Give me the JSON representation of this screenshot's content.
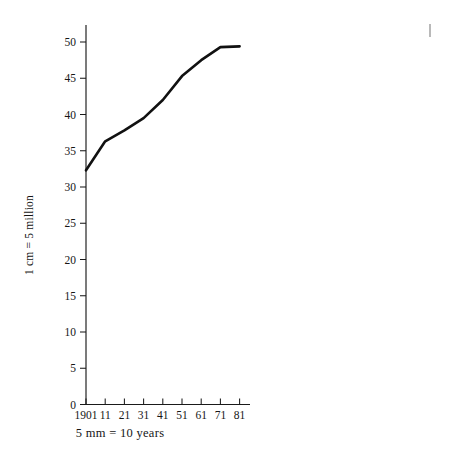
{
  "figure": {
    "background_color": "#ffffff",
    "ink_color": "#111111",
    "y_axis_label": "1 cm = 5 million",
    "x_axis_caption": "5 mm = 10 years",
    "stray_mark_name": "pencil-tick-mark"
  },
  "chart_data": {
    "type": "line",
    "title": "",
    "xlabel": "5 mm = 10 years",
    "ylabel": "1 cm = 5 million",
    "categories": [
      "1901",
      "11",
      "21",
      "31",
      "41",
      "51",
      "61",
      "71",
      "81"
    ],
    "x": [
      1901,
      1911,
      1921,
      1931,
      1941,
      1951,
      1961,
      1971,
      1981
    ],
    "values": [
      32.3,
      36.3,
      37.8,
      39.5,
      42.0,
      45.3,
      47.5,
      49.3,
      49.4
    ],
    "series": [
      {
        "name": "Population (millions)",
        "values": [
          32.3,
          36.3,
          37.8,
          39.5,
          42.0,
          45.3,
          47.5,
          49.3,
          49.4
        ]
      }
    ],
    "ylim": [
      0,
      52
    ],
    "xlim": [
      1901,
      1986
    ],
    "y_ticks": [
      0,
      5,
      10,
      15,
      20,
      25,
      30,
      35,
      40,
      45,
      50
    ],
    "y_tick_labels": [
      "0",
      "5",
      "10",
      "15",
      "20",
      "25",
      "30",
      "35",
      "40",
      "45",
      "50"
    ],
    "x_ticks": [
      1901,
      1911,
      1921,
      1931,
      1941,
      1951,
      1961,
      1971,
      1981
    ],
    "x_tick_labels": [
      "1901",
      "11",
      "21",
      "31",
      "41",
      "51",
      "61",
      "71",
      "81"
    ],
    "grid": false,
    "legend": false,
    "legend_position": "none",
    "units": "millions",
    "line_color": "#111111",
    "line_width": 2.6,
    "markers": false
  }
}
